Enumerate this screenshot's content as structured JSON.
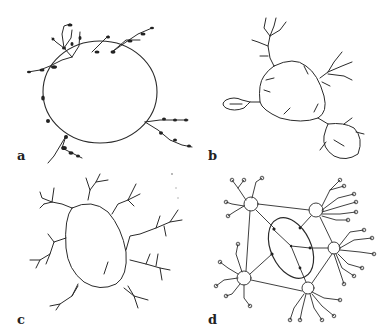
{
  "figure": {
    "panels": [
      {
        "id": "a",
        "label": "a",
        "description": "Round cell body with short branched processes bearing dark swellings"
      },
      {
        "id": "b",
        "label": "b",
        "description": "Rounded cell body with branching processes and two attached smaller bodies"
      },
      {
        "id": "c",
        "label": "c",
        "description": "Oval cell body with multiple finely branched dendrite-like processes"
      },
      {
        "id": "d",
        "label": "d",
        "description": "Central oval body connected to five peripheral circles with branching terminal-circle processes"
      }
    ],
    "colors": {
      "ink": "#2a2a2a",
      "background": "#ffffff"
    }
  }
}
